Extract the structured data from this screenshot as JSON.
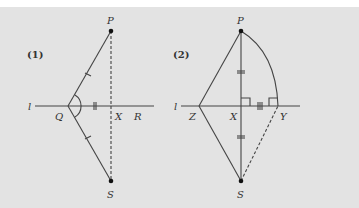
{
  "figures": [
    {
      "id": "1",
      "tag": "(1)",
      "labels": {
        "line": "l",
        "P": "P",
        "S": "S",
        "Q": "Q",
        "X": "X",
        "R": "R"
      }
    },
    {
      "id": "2",
      "tag": "(2)",
      "labels": {
        "line": "l",
        "P": "P",
        "S": "S",
        "Z": "Z",
        "X": "X",
        "Y": "Y"
      }
    }
  ],
  "colors": {
    "background": "#e3e3e3",
    "stroke": "#444444",
    "point": "#111111"
  }
}
